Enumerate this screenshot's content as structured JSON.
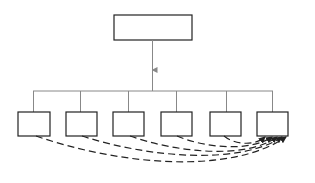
{
  "diagram": {
    "title": "",
    "colors": {
      "box_stroke": "#222222",
      "connector": "#888888",
      "dashed": "#222222",
      "background": "#ffffff"
    },
    "root": {
      "label": "",
      "x": 114,
      "y": 15,
      "w": 78,
      "h": 25
    },
    "bus": {
      "y": 91,
      "x1": 33,
      "x2": 273
    },
    "children": [
      {
        "label": "",
        "x": 18,
        "y": 112,
        "w": 32,
        "h": 24
      },
      {
        "label": "",
        "x": 66,
        "y": 112,
        "w": 31,
        "h": 24
      },
      {
        "label": "",
        "x": 113,
        "y": 112,
        "w": 31,
        "h": 24
      },
      {
        "label": "",
        "x": 161,
        "y": 112,
        "w": 31,
        "h": 24
      },
      {
        "label": "",
        "x": 210,
        "y": 112,
        "w": 31,
        "h": 24
      },
      {
        "label": "",
        "x": 257,
        "y": 112,
        "w": 31,
        "h": 24
      }
    ],
    "dashed_links": [
      {
        "from": 0,
        "to": 5
      },
      {
        "from": 1,
        "to": 5
      },
      {
        "from": 2,
        "to": 5
      },
      {
        "from": 3,
        "to": 5
      },
      {
        "from": 4,
        "to": 5
      }
    ]
  }
}
